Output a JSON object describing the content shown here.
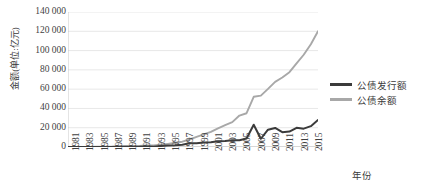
{
  "chart_data": {
    "type": "line",
    "title": "",
    "xlabel": "年份",
    "ylabel": "金额(单位:亿元)",
    "ylim": [
      0,
      140000
    ],
    "ytick_step": 20000,
    "ytick_labels": [
      "140 000",
      "120 000",
      "100 000",
      "80 000",
      "60 000",
      "40 000",
      "20 000",
      "0"
    ],
    "ytick_values": [
      140000,
      120000,
      100000,
      80000,
      60000,
      40000,
      20000,
      0
    ],
    "grid": true,
    "grid_axis": "y",
    "legend_position": "right",
    "x": [
      1981,
      1982,
      1983,
      1984,
      1985,
      1986,
      1987,
      1988,
      1989,
      1990,
      1991,
      1992,
      1993,
      1994,
      1995,
      1996,
      1997,
      1998,
      1999,
      2000,
      2001,
      2002,
      2003,
      2004,
      2005,
      2006,
      2007,
      2008,
      2009,
      2010,
      2011,
      2012,
      2013,
      2014,
      2015,
      2016
    ],
    "xtick_labels": [
      "1981",
      "1983",
      "1985",
      "1987",
      "1989",
      "1991",
      "1993",
      "1995",
      "1997",
      "1999",
      "2001",
      "2003",
      "2005",
      "2007",
      "2009",
      "2011",
      "2013",
      "2015"
    ],
    "series": [
      {
        "name": "公债发行额",
        "color": "#3b3b3b",
        "style": "solid",
        "values": [
          49,
          44,
          42,
          42,
          61,
          63,
          117,
          189,
          224,
          197,
          281,
          461,
          381,
          1138,
          1511,
          1848,
          2412,
          3891,
          4015,
          4657,
          4884,
          5934,
          6280,
          6924,
          7042,
          8883,
          23139,
          8558,
          17929,
          19778,
          15400,
          16000,
          19900,
          19000,
          21600,
          28000
        ]
      },
      {
        "name": "公债余额",
        "color": "#a8a8a8",
        "style": "solid",
        "values": [
          48,
          90,
          130,
          170,
          230,
          290,
          400,
          550,
          740,
          890,
          1100,
          1500,
          1540,
          2286,
          3300,
          4361,
          5509,
          7766,
          10542,
          13000,
          15618,
          19336,
          22603,
          25777,
          32614,
          35015,
          52074,
          53271,
          60238,
          67548,
          72044,
          77566,
          86748,
          95655,
          106600,
          120066
        ]
      }
    ],
    "annotations": []
  },
  "legend": {
    "items": [
      {
        "label": "公债发行额",
        "color": "#3b3b3b",
        "style": "solid"
      },
      {
        "label": "公债余额",
        "color": "#a8a8a8",
        "style": "solid"
      }
    ]
  },
  "axis": {
    "x_title": "年份",
    "y_title": "金额(单位:亿元)"
  }
}
